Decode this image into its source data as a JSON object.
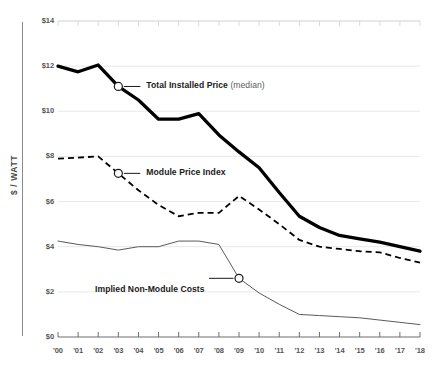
{
  "chart_data": {
    "type": "line",
    "title": "",
    "xlabel": "",
    "ylabel": "$ / WATT",
    "xlim": [
      2000,
      2018
    ],
    "ylim": [
      0,
      14
    ],
    "ytick_values": [
      0,
      2,
      4,
      6,
      8,
      10,
      12,
      14
    ],
    "ytick_labels": [
      "$0",
      "$2",
      "$4",
      "$6",
      "$8",
      "$10",
      "$12",
      "$14"
    ],
    "x": [
      2000,
      2001,
      2002,
      2003,
      2004,
      2005,
      2006,
      2007,
      2008,
      2009,
      2010,
      2011,
      2012,
      2013,
      2014,
      2015,
      2016,
      2017,
      2018
    ],
    "xtick_labels": [
      "'00",
      "'01",
      "'02",
      "'03",
      "'04",
      "'05",
      "'06",
      "'07",
      "'08",
      "'09",
      "'10",
      "'11",
      "'12",
      "'13",
      "'14",
      "'15",
      "'16",
      "'17",
      "'18"
    ],
    "grid": "horizontal",
    "legend": "inline-callout",
    "series": [
      {
        "name": "Total Installed Price (median)",
        "style": "thick-solid",
        "color": "#000000",
        "values": [
          12.0,
          11.75,
          12.05,
          11.1,
          10.5,
          9.65,
          9.65,
          9.9,
          8.95,
          8.2,
          7.5,
          6.4,
          5.35,
          4.85,
          4.5,
          4.35,
          4.2,
          4.0,
          3.8
        ]
      },
      {
        "name": "Module Price Index",
        "style": "dashed",
        "color": "#000000",
        "values": [
          7.9,
          7.95,
          8.0,
          7.25,
          6.5,
          5.85,
          5.35,
          5.5,
          5.5,
          6.25,
          5.65,
          5.0,
          4.3,
          4.0,
          3.9,
          3.8,
          3.75,
          3.5,
          3.3
        ]
      },
      {
        "name": "Implied Non-Module Costs",
        "style": "thin-solid",
        "color": "#5a5a5a",
        "values": [
          4.25,
          4.1,
          4.0,
          3.85,
          4.0,
          4.0,
          4.25,
          4.25,
          4.1,
          2.6,
          1.95,
          1.45,
          1.0,
          0.95,
          0.9,
          0.85,
          0.75,
          0.65,
          0.55
        ]
      }
    ],
    "callouts": [
      {
        "series": "Total Installed Price",
        "label_main": "Total Installed Price",
        "label_sub": "(median)",
        "marker_x": 2003,
        "marker_y": 11.1
      },
      {
        "series": "Module Price Index",
        "label_main": "Module Price Index",
        "label_sub": "",
        "marker_x": 2003,
        "marker_y": 7.25
      },
      {
        "series": "Implied Non-Module Costs",
        "label_main": "Implied Non-Module Costs",
        "label_sub": "",
        "marker_x": 2009,
        "marker_y": 2.6
      }
    ]
  },
  "axis": {
    "y_title": "$ / WATT"
  },
  "colors": {
    "ink": "#000000",
    "grid": "#e8e8e8",
    "axis": "#8a8a8a",
    "tick_text": "#555555",
    "thin_line": "#5a5a5a",
    "sub_text": "#5d5d5d"
  }
}
